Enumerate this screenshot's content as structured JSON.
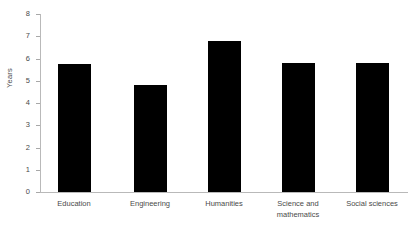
{
  "chart_data": {
    "type": "bar",
    "title": "",
    "subtitle": "",
    "xlabel": "",
    "ylabel": "Years",
    "categories": [
      "Education",
      "Engineering",
      "Humanities",
      "Science and\nmathematics",
      "Social sciences"
    ],
    "values": [
      5.75,
      4.8,
      6.8,
      5.8,
      5.8
    ],
    "ylim": [
      0,
      8
    ],
    "y_ticks": [
      0,
      1,
      2,
      3,
      4,
      5,
      6,
      7,
      8
    ],
    "y_tick_labels": [
      "0",
      "1",
      "2",
      "3",
      "4",
      "5",
      "6",
      "7",
      "8"
    ],
    "grid": false,
    "legend": false,
    "legend_position": "none",
    "bar_color": "#000000",
    "axis_color": "#b9b9b9",
    "text_color": "#4a4a4a",
    "background_color": "#ffffff"
  },
  "axis": {
    "y_title": "Years"
  },
  "ticks": {
    "t0": "0",
    "t1": "1",
    "t2": "2",
    "t3": "3",
    "t4": "4",
    "t5": "5",
    "t6": "6",
    "t7": "7",
    "t8": "8"
  },
  "categories": {
    "c0": "Education",
    "c1": "Engineering",
    "c2": "Humanities",
    "c3": "Science and\nmathematics",
    "c4": "Social sciences"
  }
}
